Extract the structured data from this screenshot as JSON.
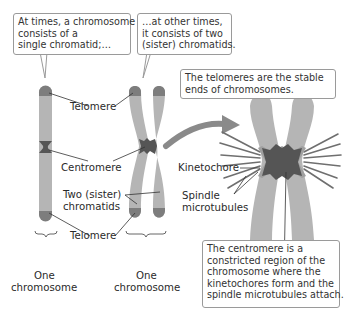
{
  "callouts": {
    "single": [
      "At times, a chromosome",
      "consists of a",
      "single chromatid;…"
    ],
    "double": [
      "…at other times,",
      "it consists of two",
      "(sister) chromatids."
    ],
    "telomeres": [
      "The telomeres are the stable",
      "ends of chromosomes."
    ],
    "centromere": [
      "The centromere is a",
      "constricted region of the",
      "chromosome where the",
      "kinetochores form and the",
      "spindle microtubules attach."
    ]
  },
  "labels": {
    "telomere_top": "Telomere",
    "centromere": "Centromere",
    "sister_line1": "Two (sister)",
    "sister_line2": "chromatids",
    "telomere_bottom": "Telomere",
    "one_chromosome_left_1": "One",
    "one_chromosome_left_2": "chromosome",
    "one_chromosome_right_1": "One",
    "one_chromosome_right_2": "chromosome",
    "kinetochore": "Kinetochore",
    "spindle_1": "Spindle",
    "spindle_2": "microtubules"
  },
  "colors": {
    "chromatid": "#b5b5b5",
    "telomere": "#7d7d7d",
    "centromere": "#555555",
    "arrow": "#8a8a8a",
    "leader_line": "#333333",
    "callout_border": "#9a9a9a"
  }
}
